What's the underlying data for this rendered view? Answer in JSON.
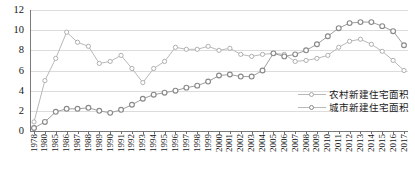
{
  "chart_data": {
    "type": "line",
    "title": "",
    "xlabel": "",
    "ylabel": "",
    "ylim": [
      0,
      12
    ],
    "yticks": [
      0,
      2,
      4,
      6,
      8,
      10,
      12
    ],
    "grid": true,
    "legend_position": "bottom-right",
    "categories": [
      "1978",
      "1980",
      "1985",
      "1986",
      "1987",
      "1988",
      "1989",
      "1990",
      "1991",
      "1992",
      "1993",
      "1994",
      "1995",
      "1996",
      "1997",
      "1998",
      "1999",
      "2000",
      "2001",
      "2002",
      "2003",
      "2004",
      "2005",
      "2006",
      "2007",
      "2008",
      "2009",
      "2010",
      "2011",
      "2012",
      "2013",
      "2014",
      "2015",
      "2016",
      "2017"
    ],
    "series": [
      {
        "name": "农村新建住宅面积",
        "marker": "circle-open",
        "color": "#b9b9b9",
        "values": [
          0.9,
          5.0,
          7.2,
          9.8,
          8.8,
          8.4,
          6.7,
          6.9,
          7.5,
          6.2,
          4.8,
          6.2,
          6.9,
          8.3,
          8.1,
          8.1,
          8.4,
          8.0,
          8.2,
          7.6,
          7.4,
          7.6,
          7.7,
          7.6,
          6.9,
          7.0,
          7.2,
          7.5,
          8.3,
          8.9,
          9.1,
          8.6,
          7.9,
          7.0,
          6.0
        ]
      },
      {
        "name": "城市新建住宅面积",
        "marker": "circle-open",
        "color": "#9e9e9e",
        "values": [
          0.3,
          0.9,
          1.9,
          2.2,
          2.2,
          2.3,
          2.0,
          1.8,
          2.1,
          2.6,
          3.2,
          3.6,
          3.8,
          4.0,
          4.3,
          4.5,
          4.9,
          5.5,
          5.6,
          5.4,
          5.4,
          6.0,
          7.7,
          7.4,
          7.6,
          8.0,
          8.6,
          9.4,
          10.2,
          10.7,
          10.8,
          10.8,
          10.4,
          9.9,
          8.5
        ]
      }
    ]
  },
  "legend": {
    "entries": [
      {
        "label": "农村新建住宅面积"
      },
      {
        "label": "城市新建住宅面积"
      }
    ]
  },
  "caption": {
    "text": ""
  }
}
